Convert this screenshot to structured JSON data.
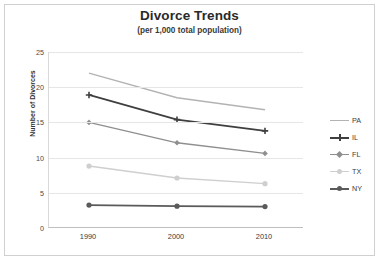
{
  "chart_data": {
    "type": "line",
    "title": "Divorce Trends",
    "subtitle": "(per 1,000 total population)",
    "xlabel": "",
    "ylabel": "Number of Divorces",
    "categories": [
      "1990",
      "2000",
      "2010"
    ],
    "x": [
      1990,
      2000,
      2010
    ],
    "ylim": [
      0,
      25
    ],
    "yticks": [
      0,
      5,
      10,
      15,
      20,
      25
    ],
    "grid": true,
    "legend_position": "right",
    "series": [
      {
        "name": "PA",
        "values": [
          22.0,
          18.5,
          16.8
        ],
        "color": "#b3b3b3",
        "marker": "none"
      },
      {
        "name": "IL",
        "values": [
          18.9,
          15.4,
          13.8
        ],
        "color": "#3f3f3f",
        "marker": "plus"
      },
      {
        "name": "FL",
        "values": [
          15.0,
          12.1,
          10.6
        ],
        "color": "#8f8f8f",
        "marker": "diamond"
      },
      {
        "name": "TX",
        "values": [
          8.8,
          7.1,
          6.3
        ],
        "color": "#cfcfcf",
        "marker": "circle"
      },
      {
        "name": "NY",
        "values": [
          3.25,
          3.1,
          3.05
        ],
        "color": "#5a5a5a",
        "marker": "circle"
      }
    ]
  },
  "legend": {
    "items": [
      {
        "label": "PA"
      },
      {
        "label": "IL"
      },
      {
        "label": "FL"
      },
      {
        "label": "TX"
      },
      {
        "label": "NY"
      }
    ]
  },
  "axes": {
    "y_tick_labels": [
      "25",
      "20",
      "15",
      "10",
      "5",
      "0"
    ],
    "x_tick_labels": [
      "1990",
      "2000",
      "2010"
    ],
    "y_axis_title": "Number of Divorces"
  },
  "colors": {
    "grid": "#e6e6e6",
    "axis": "#bfbfbf",
    "frame": "#d0d0d0",
    "background": "#ffffff",
    "title_text": "#2a2a2a",
    "tick_text": "#4a4a4a"
  }
}
